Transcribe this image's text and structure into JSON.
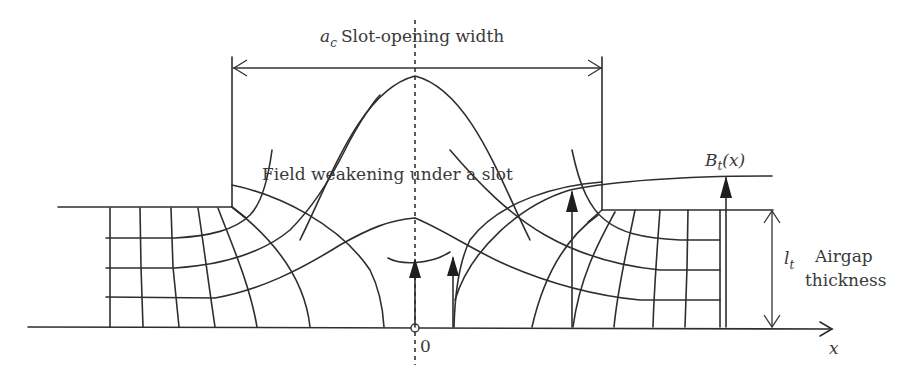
{
  "diagram": {
    "title_var": "a",
    "title_sub": "c",
    "title_text": "Slot-opening width",
    "center_label": "Field weakening under a slot",
    "flux_label_main": "B",
    "flux_label_sub": "t",
    "flux_label_arg": "(x)",
    "gap_symbol_main": "l",
    "gap_symbol_sub": "t",
    "gap_label_line1": "Airgap",
    "gap_label_line2": "thickness",
    "origin_label": "0",
    "axis_label": "x",
    "colors": {
      "line": "#2e2e2e",
      "text": "#3a3a3a",
      "background": "#ffffff"
    }
  }
}
